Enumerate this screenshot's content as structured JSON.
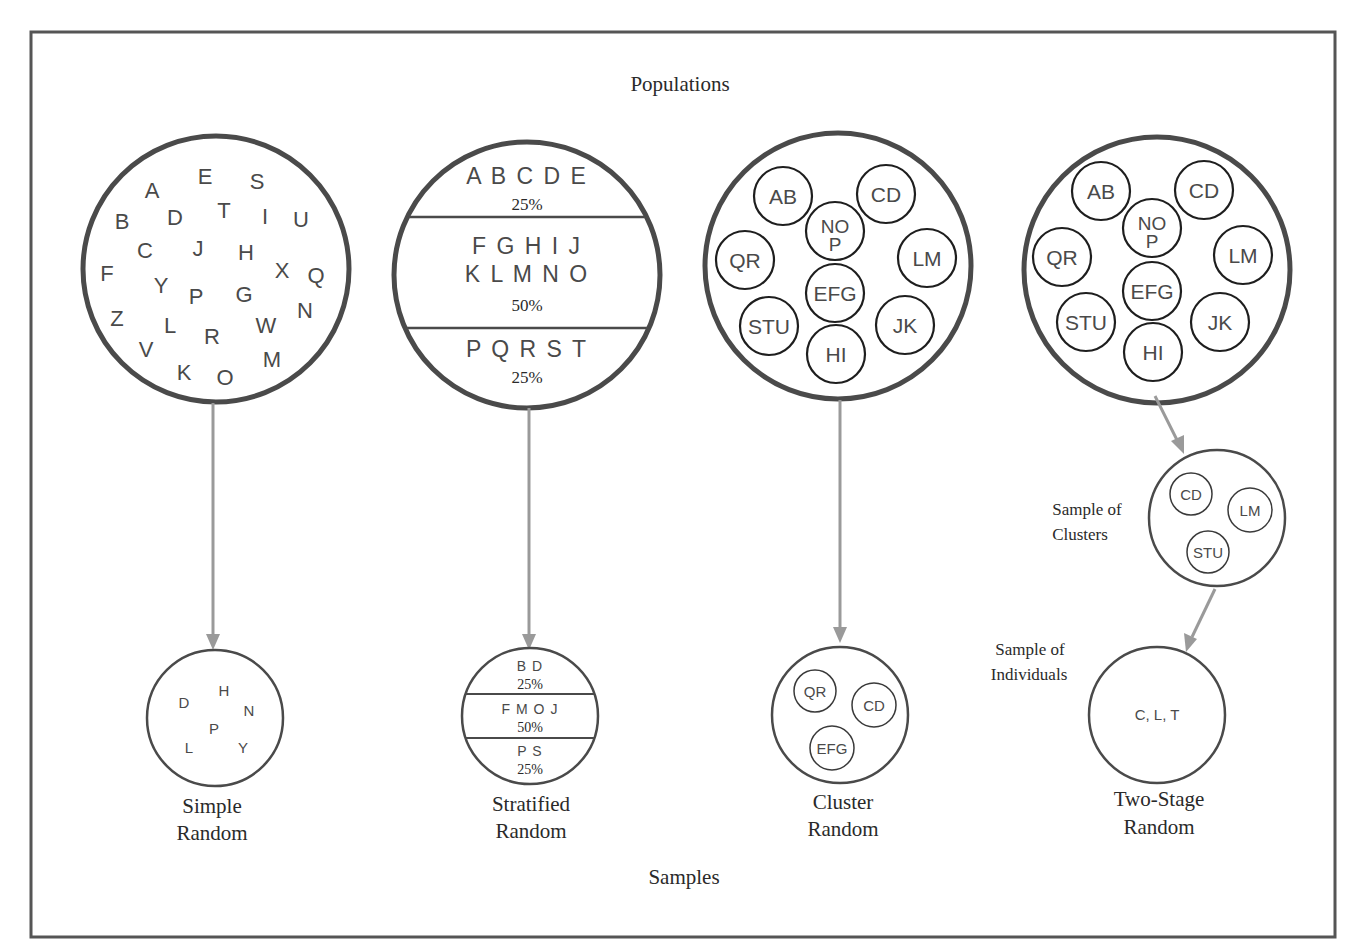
{
  "title_top": "Populations",
  "title_bottom": "Samples",
  "colors": {
    "frame": "#555555",
    "circle_stroke": "#4a4a4a",
    "arrow": "#9a9a9a",
    "text": "#2a2a2a"
  },
  "methods": [
    {
      "name": "Simple Random",
      "label_lines": [
        "Simple",
        "Random"
      ],
      "population": {
        "type": "letters",
        "letters": [
          "A",
          "E",
          "S",
          "B",
          "D",
          "T",
          "I",
          "U",
          "C",
          "J",
          "H",
          "F",
          "X",
          "Q",
          "Y",
          "P",
          "G",
          "Z",
          "L",
          "W",
          "N",
          "R",
          "V",
          "M",
          "K",
          "O"
        ]
      },
      "sample": {
        "type": "letters",
        "letters": [
          "D",
          "H",
          "N",
          "P",
          "L",
          "Y"
        ]
      }
    },
    {
      "name": "Stratified Random",
      "label_lines": [
        "Stratified",
        "Random"
      ],
      "population": {
        "type": "strata",
        "strata": [
          {
            "lines": [
              "A B C D E"
            ],
            "pct": "25%"
          },
          {
            "lines": [
              "F G H I J",
              "K L M N O"
            ],
            "pct": "50%"
          },
          {
            "lines": [
              "P Q R S T"
            ],
            "pct": "25%"
          }
        ]
      },
      "sample": {
        "type": "strata",
        "strata": [
          {
            "letters": "B D",
            "pct": "25%"
          },
          {
            "letters": "F M O J",
            "pct": "50%"
          },
          {
            "letters": "P S",
            "pct": "25%"
          }
        ]
      }
    },
    {
      "name": "Cluster Random",
      "label_lines": [
        "Cluster",
        "Random"
      ],
      "population": {
        "type": "clusters",
        "clusters": [
          "AB",
          "CD",
          "NO P",
          "QR",
          "LM",
          "EFG",
          "STU",
          "JK",
          "HI"
        ]
      },
      "sample": {
        "type": "clusters",
        "clusters": [
          "QR",
          "CD",
          "EFG"
        ]
      }
    },
    {
      "name": "Two-Stage Random",
      "label_lines": [
        "Two-Stage",
        "Random"
      ],
      "population": {
        "type": "clusters",
        "clusters": [
          "AB",
          "CD",
          "NO P",
          "QR",
          "LM",
          "EFG",
          "STU",
          "JK",
          "HI"
        ]
      },
      "intermediate": {
        "label_lines": [
          "Sample of",
          "Clusters"
        ],
        "clusters": [
          "CD",
          "LM",
          "STU"
        ]
      },
      "sample": {
        "label_lines": [
          "Sample of",
          "Individuals"
        ],
        "text": "C, L, T"
      }
    }
  ]
}
